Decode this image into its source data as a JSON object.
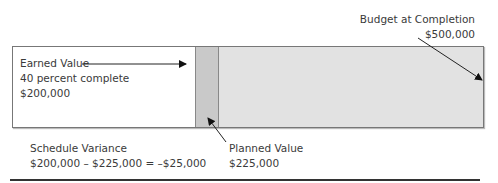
{
  "diagram": {
    "type": "earned-value-bar",
    "colors": {
      "earned": "#ffffff",
      "planned_gap": "#c9c9c9",
      "remaining": "#e2e2e2",
      "border": "#777777"
    },
    "earned_value": {
      "title": "Earned Value",
      "percent": "40 percent complete",
      "amount": "$200,000"
    },
    "planned_value": {
      "title": "Planned Value",
      "amount": "$225,000"
    },
    "budget_at_completion": {
      "title": "Budget at Completion",
      "amount": "$500,000"
    },
    "schedule_variance": {
      "title": "Schedule Variance",
      "formula": "$200,000 – $225,000 = –$25,000"
    }
  }
}
